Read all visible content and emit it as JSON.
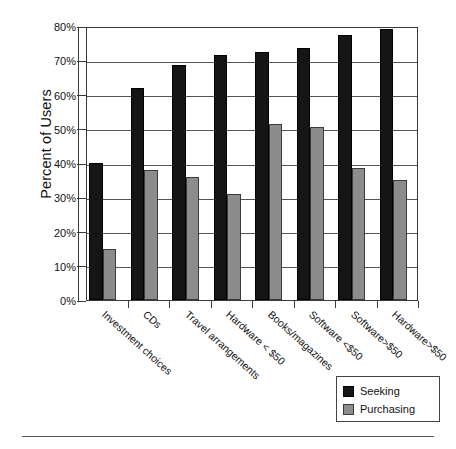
{
  "chart_data": {
    "type": "bar",
    "title": "",
    "xlabel": "",
    "ylabel": "Percent of Users",
    "ylim": [
      0,
      80
    ],
    "ytick_values": [
      0,
      10,
      20,
      30,
      40,
      50,
      60,
      70,
      80
    ],
    "ytick_labels": [
      "0%",
      "10%",
      "20%",
      "30%",
      "40%",
      "50%",
      "60%",
      "70%",
      "80%"
    ],
    "grid": true,
    "legend_position": "bottom-right",
    "categories": [
      "Investment choices",
      "CDs",
      "Travel arrangements",
      "Hardware < $50",
      "Books/magazines",
      "Software <$50",
      "Software>$50",
      "Hardware>$50"
    ],
    "series": [
      {
        "name": "Seeking",
        "color": "#151515",
        "values": [
          40,
          62,
          68.5,
          71.5,
          72.5,
          73.5,
          77.5,
          79
        ]
      },
      {
        "name": "Purchasing",
        "color": "#8c8c8c",
        "values": [
          15,
          38,
          36,
          31,
          51.5,
          50.5,
          38.5,
          35
        ]
      }
    ]
  },
  "legend": {
    "items": [
      {
        "label": "Seeking",
        "swatch": "seek"
      },
      {
        "label": "Purchasing",
        "swatch": "purch"
      }
    ]
  }
}
